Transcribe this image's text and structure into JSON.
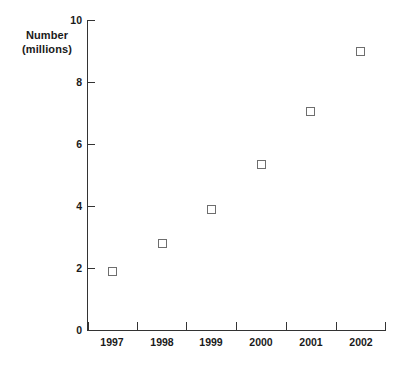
{
  "chart_data": {
    "type": "scatter",
    "title": "",
    "xlabel": "",
    "ylabel": "Number (millions)",
    "ylabel_lines": [
      "Number",
      "(millions)"
    ],
    "categories": [
      "1997",
      "1998",
      "1999",
      "2000",
      "2001",
      "2002"
    ],
    "values": [
      1.9,
      2.8,
      3.9,
      5.35,
      7.05,
      9.0
    ],
    "series": [
      {
        "name": "Number (millions)",
        "values": [
          1.9,
          2.8,
          3.9,
          5.35,
          7.05,
          9.0
        ]
      }
    ],
    "points": [
      {
        "x": "1997",
        "y": 1.9
      },
      {
        "x": "1998",
        "y": 2.8
      },
      {
        "x": "1999",
        "y": 3.9
      },
      {
        "x": "2000",
        "y": 5.35
      },
      {
        "x": "2001",
        "y": 7.05
      },
      {
        "x": "2002",
        "y": 9.0
      }
    ],
    "ylim": [
      0,
      10
    ],
    "ytick_labels": [
      "0",
      "2",
      "4",
      "6",
      "8",
      "10"
    ],
    "ytick_values": [
      0,
      2,
      4,
      6,
      8,
      10
    ],
    "xtick_labels": [
      "1997",
      "1998",
      "1999",
      "2000",
      "2001",
      "2002"
    ],
    "grid": false,
    "legend": false,
    "legend_position": "none",
    "marker_style": "open-square",
    "colors": {
      "marker_outline": "#6e6e6e",
      "axis": "#333333",
      "text": "#1a1a1a",
      "background": "#ffffff"
    }
  }
}
